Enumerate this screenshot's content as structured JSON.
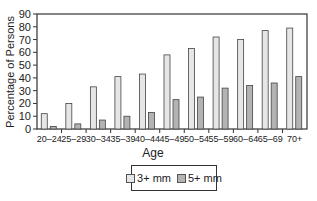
{
  "chart_data": {
    "type": "bar",
    "title": "",
    "xlabel": "Age",
    "ylabel": "Percentage of Persons",
    "ylim": [
      0,
      90
    ],
    "yticks": [
      0,
      10,
      20,
      30,
      40,
      50,
      60,
      70,
      80,
      90
    ],
    "grid": false,
    "legend_position": "bottom-center",
    "categories": [
      "20–24",
      "25–29",
      "30–34",
      "35–39",
      "40–44",
      "45–49",
      "50–54",
      "55–59",
      "60–64",
      "65–69",
      "70+"
    ],
    "series": [
      {
        "name": "3+ mm",
        "color": "#e6e6e6",
        "values": [
          12,
          20,
          33,
          41,
          43,
          58,
          63,
          72,
          70,
          77,
          79
        ]
      },
      {
        "name": "5+ mm",
        "color": "#b3b3b3",
        "values": [
          2,
          4,
          7,
          10,
          13,
          23,
          25,
          32,
          34,
          36,
          41
        ]
      }
    ]
  },
  "legend": {
    "items": [
      {
        "label": "3+ mm",
        "color": "#e6e6e6"
      },
      {
        "label": "5+ mm",
        "color": "#b3b3b3"
      }
    ]
  }
}
